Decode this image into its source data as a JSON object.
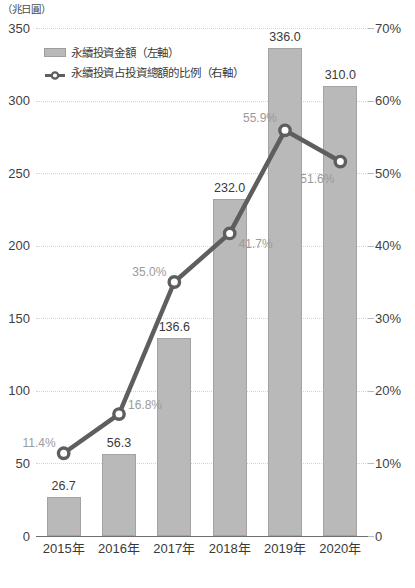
{
  "chart_data": {
    "type": "bar",
    "title": "",
    "subtitle": "",
    "xlabel": "",
    "ylabel": "（兆日圓）",
    "left_axis": {
      "unit_label": "（兆日圓）",
      "ylim": [
        0,
        350
      ],
      "ticks": [
        0,
        50,
        100,
        150,
        200,
        250,
        300,
        350
      ],
      "tick_labels": [
        "0",
        "50",
        "100",
        "150",
        "200",
        "250",
        "300",
        "350"
      ]
    },
    "right_axis": {
      "ylim": [
        0,
        70
      ],
      "ticks": [
        0,
        10,
        20,
        30,
        40,
        50,
        60,
        70
      ],
      "tick_labels": [
        "0",
        "10%",
        "20%",
        "30%",
        "40%",
        "50%",
        "60%",
        "70%"
      ]
    },
    "categories": [
      "2015年",
      "2016年",
      "2017年",
      "2018年",
      "2019年",
      "2020年"
    ],
    "series": [
      {
        "name": "永續投資金額（左軸）",
        "type": "bar",
        "axis": "left",
        "values": [
          26.7,
          56.3,
          136.6,
          232.0,
          336.0,
          310.0
        ],
        "data_labels": [
          "26.7",
          "56.3",
          "136.6",
          "232.0",
          "336.0",
          "310.0"
        ],
        "color": "#b9b9b9"
      },
      {
        "name": "永續投資占投資總額的比例（右軸）",
        "type": "line",
        "axis": "right",
        "values": [
          11.4,
          16.8,
          35.0,
          41.7,
          55.9,
          51.6
        ],
        "data_labels": [
          "11.4%",
          "16.8%",
          "35.0%",
          "41.7%",
          "55.9%",
          "51.6%"
        ],
        "color": "#5e5e5e"
      }
    ],
    "grid": true,
    "legend_position": "top-left"
  },
  "legend": {
    "items": [
      {
        "label": "永續投資金額（左軸）",
        "marker": "bar-swatch-icon"
      },
      {
        "label": "永續投資占投資總額的比例（右軸）",
        "marker": "line-marker-icon"
      }
    ]
  },
  "colors": {
    "bar_fill": "#b9b9b9",
    "bar_stroke": "#a3a3a3",
    "line": "#5e5e5e",
    "marker_fill": "#ffffff",
    "grid": "#d4d4d4",
    "axis": "#6f6f6f",
    "bar_label_text": "#3a3a3a",
    "pct_label_text": "#9b9b9b"
  }
}
